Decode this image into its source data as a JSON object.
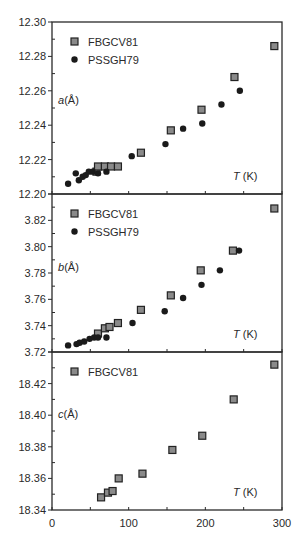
{
  "chart_data": [
    {
      "type": "scatter",
      "panel": "a",
      "ylabel": "a (Å)",
      "xlabel": "T (K)",
      "xlim": [
        0,
        300
      ],
      "ylim": [
        12.2,
        12.3
      ],
      "yticks": [
        "12.20",
        "12.22",
        "12.24",
        "12.26",
        "12.28",
        "12.30"
      ],
      "legend": [
        "FBGCV81",
        "PSSGH79"
      ],
      "legend_position": "upper-left",
      "grid": false,
      "series": [
        {
          "name": "FBGCV81",
          "marker": "square",
          "x": [
            58,
            60,
            69,
            77,
            86,
            116,
            155,
            195,
            238,
            290
          ],
          "y": [
            12.213,
            12.216,
            12.216,
            12.216,
            12.216,
            12.224,
            12.237,
            12.249,
            12.268,
            12.286
          ]
        },
        {
          "name": "PSSGH79",
          "marker": "circle-filled",
          "x": [
            21,
            31,
            35,
            40,
            44,
            48,
            53,
            60,
            71,
            104,
            148,
            171,
            196,
            221,
            245
          ],
          "y": [
            12.206,
            12.212,
            12.208,
            12.21,
            12.211,
            12.213,
            12.213,
            12.212,
            12.213,
            12.222,
            12.229,
            12.238,
            12.241,
            12.252,
            12.26
          ]
        }
      ]
    },
    {
      "type": "scatter",
      "panel": "b",
      "ylabel": "b (Å)",
      "xlabel": "T (K)",
      "xlim": [
        0,
        300
      ],
      "ylim": [
        3.72,
        3.84
      ],
      "yticks": [
        "3.72",
        "3.74",
        "3.76",
        "3.78",
        "3.80",
        "3.82"
      ],
      "legend": [
        "FBGCV81",
        "PSSGH79"
      ],
      "legend_position": "upper-left",
      "grid": false,
      "series": [
        {
          "name": "FBGCV81",
          "marker": "square",
          "x": [
            60,
            69,
            75,
            86,
            116,
            155,
            194,
            236,
            290
          ],
          "y": [
            3.734,
            3.738,
            3.739,
            3.742,
            3.752,
            3.763,
            3.782,
            3.797,
            3.829
          ]
        },
        {
          "name": "PSSGH79",
          "marker": "circle-filled",
          "x": [
            21,
            32,
            36,
            42,
            49,
            55,
            60,
            71,
            105,
            147,
            171,
            195,
            219,
            244
          ],
          "y": [
            3.725,
            3.726,
            3.727,
            3.728,
            3.73,
            3.731,
            3.731,
            3.731,
            3.742,
            3.751,
            3.761,
            3.771,
            3.782,
            3.797
          ]
        }
      ]
    },
    {
      "type": "scatter",
      "panel": "c",
      "ylabel": "c (Å)",
      "xlabel": "T (K)",
      "xlim": [
        0,
        300
      ],
      "ylim": [
        18.34,
        18.44
      ],
      "yticks": [
        "18.34",
        "18.36",
        "18.38",
        "18.40",
        "18.42"
      ],
      "xticks": [
        "0",
        "100",
        "200",
        "300"
      ],
      "legend": [
        "FBGCV81"
      ],
      "legend_position": "upper-left",
      "grid": false,
      "series": [
        {
          "name": "FBGCV81",
          "marker": "square",
          "x": [
            64,
            73,
            79,
            87,
            118,
            157,
            196,
            237,
            290
          ],
          "y": [
            18.348,
            18.351,
            18.352,
            18.36,
            18.363,
            18.378,
            18.387,
            18.41,
            18.432
          ]
        }
      ]
    }
  ],
  "labels": {
    "panel_a_ylabel_var": "a",
    "panel_b_ylabel_var": "b",
    "panel_c_ylabel_var": "c",
    "ylabel_unit": "(Å)",
    "xlabel_var": "T",
    "xlabel_unit": "(K)",
    "legend_fbgcv81": "FBGCV81",
    "legend_pssgh79": "PSSGH79"
  },
  "colors": {
    "axis": "#2a2a2a",
    "square_fill": "#8a8a8a",
    "square_stroke": "#222222",
    "dot_fill": "#1a1a1a"
  }
}
